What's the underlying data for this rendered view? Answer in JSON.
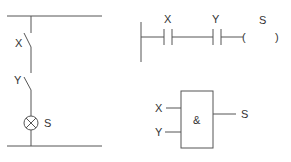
{
  "circuit": {
    "switch_1_label": "X",
    "switch_2_label": "Y",
    "lamp_label": "S"
  },
  "ladder": {
    "contact_1_label": "X",
    "contact_2_label": "Y",
    "coil_label": "S",
    "coil_open": "(",
    "coil_close": ")"
  },
  "logic_gate": {
    "input_1_label": "X",
    "input_2_label": "Y",
    "gate_symbol": "&",
    "output_label": "S"
  },
  "colors": {
    "line": "#555555",
    "text": "#333333",
    "background": "#ffffff"
  }
}
